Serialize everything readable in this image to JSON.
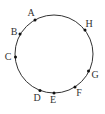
{
  "diagram": {
    "circle": {
      "cx": 54,
      "cy": 54,
      "r": 39,
      "stroke": "#333333"
    },
    "points": [
      {
        "label": "A",
        "x": 35,
        "y": 20,
        "lx": 31,
        "ly": 14
      },
      {
        "label": "B",
        "x": 20,
        "y": 34,
        "lx": 14,
        "ly": 33
      },
      {
        "label": "C",
        "x": 15.5,
        "y": 57,
        "lx": 8,
        "ly": 58
      },
      {
        "label": "D",
        "x": 40,
        "y": 90.5,
        "lx": 37,
        "ly": 99
      },
      {
        "label": "E",
        "x": 54,
        "y": 93,
        "lx": 53,
        "ly": 101
      },
      {
        "label": "F",
        "x": 75,
        "y": 87,
        "lx": 79,
        "ly": 94
      },
      {
        "label": "G",
        "x": 88.5,
        "y": 71,
        "lx": 95,
        "ly": 76
      },
      {
        "label": "H",
        "x": 85,
        "y": 30,
        "lx": 89,
        "ly": 25
      }
    ]
  }
}
